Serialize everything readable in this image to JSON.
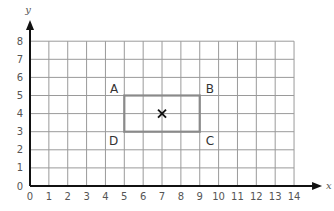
{
  "diagram": {
    "type": "coordinate-grid",
    "x_axis": {
      "label": "x",
      "min": 0,
      "max": 14,
      "ticks": [
        "0",
        "1",
        "2",
        "3",
        "4",
        "5",
        "6",
        "7",
        "8",
        "9",
        "10",
        "11",
        "12",
        "13",
        "14"
      ]
    },
    "y_axis": {
      "label": "y",
      "min": 0,
      "max": 8,
      "ticks": [
        "0",
        "1",
        "2",
        "3",
        "4",
        "5",
        "6",
        "7",
        "8"
      ]
    },
    "rectangle": {
      "vertices": [
        {
          "label": "A",
          "x": 5,
          "y": 5
        },
        {
          "label": "B",
          "x": 9,
          "y": 5
        },
        {
          "label": "C",
          "x": 9,
          "y": 3
        },
        {
          "label": "D",
          "x": 5,
          "y": 3
        }
      ],
      "stroke_color": "#8a8a8a"
    },
    "center_mark": {
      "symbol": "×",
      "x": 7,
      "y": 4
    },
    "colors": {
      "grid": "#9a9a9a",
      "axis": "#111111",
      "rect": "#8a8a8a",
      "text": "#555555"
    }
  },
  "layout": {
    "origin_px": [
      30,
      186
    ],
    "unit_x_px": 18.86,
    "unit_y_px": 18.1
  }
}
